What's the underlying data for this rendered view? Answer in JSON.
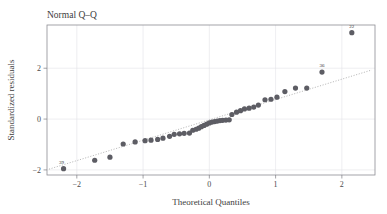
{
  "chart_data": {
    "type": "scatter",
    "title": "Normal Q–Q",
    "subtitle": "",
    "xlabel": "Theoretical Quantiles",
    "ylabel": "Standardized residuals",
    "xlim": [
      -2.45,
      2.5
    ],
    "ylim": [
      -2.2,
      3.7
    ],
    "xticks": [
      -2,
      -1,
      0,
      1,
      2
    ],
    "xticklabels": [
      "−2",
      "−1",
      "0",
      "1",
      "2"
    ],
    "yticks": [
      -2,
      0,
      2
    ],
    "yticklabels": [
      "−2",
      "0",
      "2"
    ],
    "grid": true,
    "grid_x": [
      -2,
      -1,
      0,
      1,
      2
    ],
    "grid_y": [
      -2,
      0,
      2
    ],
    "legend": null,
    "reference_line": {
      "type": "qq-line",
      "style": "dotted",
      "color": "#9a9a9a",
      "x": [
        -2.42,
        2.45
      ],
      "y": [
        -1.97,
        1.93
      ]
    },
    "marker": {
      "shape": "circle",
      "color": "#5d5d64",
      "size": 2.6
    },
    "x": [
      -2.2,
      -1.73,
      -1.5,
      -1.3,
      -1.12,
      -0.97,
      -0.88,
      -0.78,
      -0.7,
      -0.6,
      -0.53,
      -0.45,
      -0.38,
      -0.3,
      -0.25,
      -0.2,
      -0.16,
      -0.12,
      -0.08,
      -0.04,
      0.0,
      0.04,
      0.08,
      0.12,
      0.16,
      0.2,
      0.25,
      0.3,
      0.34,
      0.41,
      0.47,
      0.53,
      0.6,
      0.67,
      0.74,
      0.84,
      0.93,
      1.02,
      1.14,
      1.3,
      1.47,
      1.7,
      2.15
    ],
    "y": [
      -1.95,
      -1.62,
      -1.5,
      -0.98,
      -0.9,
      -0.85,
      -0.83,
      -0.8,
      -0.75,
      -0.68,
      -0.6,
      -0.58,
      -0.56,
      -0.55,
      -0.44,
      -0.4,
      -0.36,
      -0.3,
      -0.25,
      -0.2,
      -0.15,
      -0.12,
      -0.1,
      -0.08,
      -0.06,
      -0.05,
      -0.04,
      -0.03,
      0.18,
      0.27,
      0.33,
      0.4,
      0.43,
      0.47,
      0.55,
      0.76,
      0.78,
      0.86,
      1.08,
      1.22,
      1.22,
      1.85,
      3.4
    ],
    "annotations": [
      {
        "label": "39",
        "x": -2.2,
        "y": -1.95,
        "dx": -2,
        "dy": -5,
        "anchor": "middle"
      },
      {
        "label": "36",
        "x": 1.7,
        "y": 1.85,
        "dx": 0,
        "dy": -5,
        "anchor": "middle"
      },
      {
        "label": "22",
        "x": 2.15,
        "y": 3.4,
        "dx": 0,
        "dy": -5,
        "anchor": "middle"
      }
    ]
  }
}
